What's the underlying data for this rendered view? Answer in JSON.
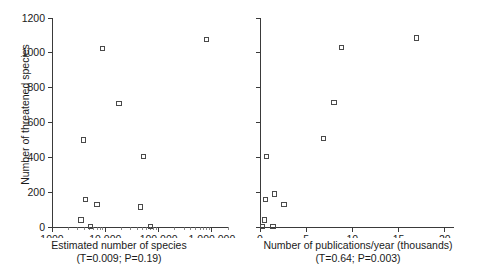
{
  "figure": {
    "background_color": "#ffffff",
    "marker_color": "#4a4a4a",
    "axis_color": "#3a3a3a",
    "text_color": "#1a1a1a",
    "shared_ylabel": "Number of threatened species"
  },
  "chart_data": [
    {
      "type": "scatter",
      "panel": "left",
      "title": "",
      "xlabel": "Estimated number of species",
      "xlabel_sub": "(T=0.009; P=0.19)",
      "ylabel": "Number of threatened species",
      "xscale": "log",
      "xlim": [
        1000,
        2000000
      ],
      "ylim": [
        0,
        1200
      ],
      "xticks": [
        1000,
        10000,
        100000,
        1000000
      ],
      "xticklabels": [
        "1000",
        "10 000",
        "100 000",
        "1 000 000"
      ],
      "yticks": [
        0,
        200,
        400,
        600,
        800,
        1000,
        1200
      ],
      "yticklabels": [
        "0",
        "200",
        "400",
        "600",
        "800",
        "1000",
        "1200"
      ],
      "grid": false,
      "legend": null,
      "stats": {
        "T": 0.009,
        "P": 0.19
      },
      "points": [
        {
          "x": 3500,
          "y": 40
        },
        {
          "x": 3900,
          "y": 500
        },
        {
          "x": 4300,
          "y": 160
        },
        {
          "x": 5200,
          "y": 5
        },
        {
          "x": 7000,
          "y": 130
        },
        {
          "x": 9000,
          "y": 1025
        },
        {
          "x": 18000,
          "y": 710
        },
        {
          "x": 45000,
          "y": 115
        },
        {
          "x": 52000,
          "y": 405
        },
        {
          "x": 70000,
          "y": 5
        },
        {
          "x": 800000,
          "y": 1075
        }
      ]
    },
    {
      "type": "scatter",
      "panel": "right",
      "title": "",
      "xlabel": "Number of publications/year (thousands)",
      "xlabel_sub": "(T=0.64; P=0.003)",
      "ylabel": "Number of threatened species",
      "xscale": "linear",
      "xlim": [
        0,
        21
      ],
      "ylim": [
        0,
        1200
      ],
      "xticks": [
        0,
        5,
        10,
        15,
        20
      ],
      "xticklabels": [
        "0",
        "5",
        "10",
        "15",
        "20"
      ],
      "yticks": [
        0,
        200,
        400,
        600,
        800,
        1000,
        1200
      ],
      "yticklabels": [],
      "grid": false,
      "legend": null,
      "stats": {
        "T": 0.64,
        "P": 0.003
      },
      "points": [
        {
          "x": 0.3,
          "y": 5
        },
        {
          "x": 0.5,
          "y": 40
        },
        {
          "x": 0.6,
          "y": 160
        },
        {
          "x": 0.7,
          "y": 405
        },
        {
          "x": 1.4,
          "y": 5
        },
        {
          "x": 1.6,
          "y": 190
        },
        {
          "x": 2.6,
          "y": 130
        },
        {
          "x": 6.9,
          "y": 510
        },
        {
          "x": 8.0,
          "y": 715
        },
        {
          "x": 8.8,
          "y": 1030
        },
        {
          "x": 16.9,
          "y": 1085
        }
      ]
    }
  ]
}
